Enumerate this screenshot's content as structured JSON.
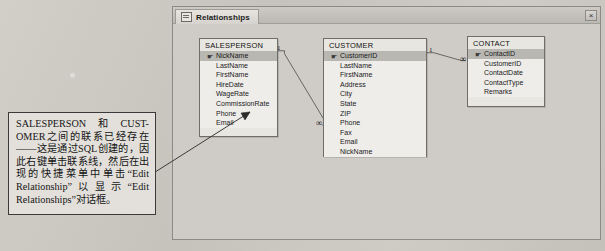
{
  "window": {
    "tab_label": "Relationships",
    "tab_icon": "relationships-window-icon",
    "close_label": "×"
  },
  "tables": [
    {
      "name": "SALESPERSON",
      "fields": [
        {
          "label": "NickName",
          "primary_key": true
        },
        {
          "label": "LastName",
          "primary_key": false
        },
        {
          "label": "FirstName",
          "primary_key": false
        },
        {
          "label": "HireDate",
          "primary_key": false
        },
        {
          "label": "WageRate",
          "primary_key": false
        },
        {
          "label": "CommissionRate",
          "primary_key": false
        },
        {
          "label": "Phone",
          "primary_key": false
        },
        {
          "label": "Email",
          "primary_key": false
        }
      ]
    },
    {
      "name": "CUSTOMER",
      "fields": [
        {
          "label": "CustomerID",
          "primary_key": true
        },
        {
          "label": "LastName",
          "primary_key": false
        },
        {
          "label": "FirstName",
          "primary_key": false
        },
        {
          "label": "Address",
          "primary_key": false
        },
        {
          "label": "City",
          "primary_key": false
        },
        {
          "label": "State",
          "primary_key": false
        },
        {
          "label": "ZIP",
          "primary_key": false
        },
        {
          "label": "Phone",
          "primary_key": false
        },
        {
          "label": "Fax",
          "primary_key": false
        },
        {
          "label": "Email",
          "primary_key": false
        },
        {
          "label": "NickName",
          "primary_key": false
        }
      ]
    },
    {
      "name": "CONTACT",
      "fields": [
        {
          "label": "ContactID",
          "primary_key": true
        },
        {
          "label": "CustomerID",
          "primary_key": false
        },
        {
          "label": "ContactDate",
          "primary_key": false
        },
        {
          "label": "ContactType",
          "primary_key": false
        },
        {
          "label": "Remarks",
          "primary_key": false
        }
      ]
    }
  ],
  "relationships": [
    {
      "from": "SALESPERSON",
      "to": "CUSTOMER",
      "one_marker": "1",
      "many_marker": "∞"
    },
    {
      "from": "CUSTOMER",
      "to": "CONTACT",
      "one_marker": "1",
      "many_marker": "∞"
    }
  ],
  "note": {
    "text": "SALESPERSON和CUST-OMER之间的联系已经存在——这是通过SQL创建的，因此右键单击联系线，然后在出现的快捷菜单中单击“Edit Relationship”以显示“Edit Relationships”对话框。"
  },
  "colors": {
    "page_background": "#cbc8c2",
    "window_background": "#cfccc7",
    "table_fill": "#efedea",
    "table_border": "#6f6d68",
    "pk_row_highlight": "#b9b7b2",
    "note_fill": "#e3e0db",
    "note_border": "#3a3a3a",
    "relationship_line": "#4a4a4a"
  }
}
